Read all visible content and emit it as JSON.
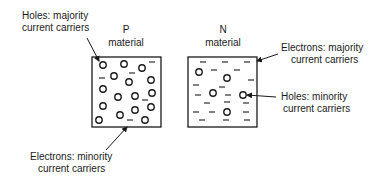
{
  "diagram": {
    "p_material": {
      "title_line1": "P",
      "title_line2": "material",
      "holes": [
        [
          103,
          65
        ],
        [
          124,
          64
        ],
        [
          142,
          68
        ],
        [
          114,
          76
        ],
        [
          129,
          82
        ],
        [
          151,
          80
        ],
        [
          103,
          89
        ],
        [
          118,
          97
        ],
        [
          135,
          96
        ],
        [
          152,
          93
        ],
        [
          103,
          106
        ],
        [
          135,
          110
        ],
        [
          151,
          107
        ],
        [
          120,
          115
        ],
        [
          145,
          120
        ],
        [
          99,
          120
        ]
      ],
      "electrons": [
        [
          152,
          62
        ],
        [
          102,
          78
        ],
        [
          132,
          73
        ],
        [
          145,
          100
        ],
        [
          130,
          120
        ]
      ]
    },
    "n_material": {
      "title_line1": "N",
      "title_line2": "material",
      "holes": [
        [
          199,
          72
        ],
        [
          227,
          78
        ],
        [
          213,
          93
        ],
        [
          243,
          95
        ],
        [
          227,
          112
        ]
      ],
      "electrons": [
        [
          203,
          62
        ],
        [
          225,
          62
        ],
        [
          247,
          62
        ],
        [
          214,
          70
        ],
        [
          237,
          70
        ],
        [
          196,
          85
        ],
        [
          222,
          87
        ],
        [
          251,
          80
        ],
        [
          198,
          95
        ],
        [
          228,
          95
        ],
        [
          207,
          103
        ],
        [
          227,
          102
        ],
        [
          246,
          103
        ],
        [
          196,
          112
        ],
        [
          212,
          112
        ],
        [
          246,
          112
        ],
        [
          202,
          120
        ],
        [
          226,
          120
        ],
        [
          247,
          120
        ]
      ]
    },
    "annotations": {
      "holes_majority_line1": "Holes: majority",
      "holes_majority_line2": "current carriers",
      "electrons_majority_line1": "Electrons: majority",
      "electrons_majority_line2": "current carriers",
      "holes_minority_line1": "Holes: minority",
      "holes_minority_line2": "current carriers",
      "electrons_minority_line1": "Electrons: minority",
      "electrons_minority_line2": "current carriers"
    }
  }
}
